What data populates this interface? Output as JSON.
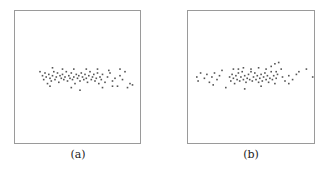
{
  "figure": {
    "panels": [
      {
        "id": "a",
        "caption": "(a)"
      },
      {
        "id": "b",
        "caption": "(b)"
      }
    ]
  },
  "chart_data": [
    {
      "type": "scatter",
      "title": "",
      "caption": "(a)",
      "xlabel": "",
      "ylabel": "",
      "axes_visible": false,
      "grid": false,
      "xlim": [
        0,
        1
      ],
      "ylim": [
        0,
        1
      ],
      "point_color": "#555555",
      "points": [
        [
          0.2,
          0.46
        ],
        [
          0.22,
          0.49
        ],
        [
          0.23,
          0.52
        ],
        [
          0.24,
          0.47
        ],
        [
          0.25,
          0.5
        ],
        [
          0.26,
          0.55
        ],
        [
          0.27,
          0.48
        ],
        [
          0.28,
          0.51
        ],
        [
          0.29,
          0.53
        ],
        [
          0.3,
          0.49
        ],
        [
          0.31,
          0.46
        ],
        [
          0.32,
          0.52
        ],
        [
          0.33,
          0.5
        ],
        [
          0.34,
          0.47
        ],
        [
          0.35,
          0.54
        ],
        [
          0.36,
          0.49
        ],
        [
          0.37,
          0.51
        ],
        [
          0.38,
          0.48
        ],
        [
          0.39,
          0.52
        ],
        [
          0.4,
          0.5
        ],
        [
          0.41,
          0.46
        ],
        [
          0.42,
          0.53
        ],
        [
          0.43,
          0.49
        ],
        [
          0.44,
          0.51
        ],
        [
          0.45,
          0.47
        ],
        [
          0.46,
          0.52
        ],
        [
          0.47,
          0.5
        ],
        [
          0.48,
          0.55
        ],
        [
          0.49,
          0.48
        ],
        [
          0.5,
          0.51
        ],
        [
          0.51,
          0.49
        ],
        [
          0.52,
          0.53
        ],
        [
          0.53,
          0.47
        ],
        [
          0.54,
          0.5
        ],
        [
          0.55,
          0.52
        ],
        [
          0.56,
          0.48
        ],
        [
          0.57,
          0.51
        ],
        [
          0.58,
          0.54
        ],
        [
          0.59,
          0.49
        ],
        [
          0.6,
          0.46
        ],
        [
          0.61,
          0.52
        ],
        [
          0.62,
          0.5
        ],
        [
          0.63,
          0.48
        ],
        [
          0.64,
          0.53
        ],
        [
          0.65,
          0.51
        ],
        [
          0.66,
          0.47
        ],
        [
          0.67,
          0.55
        ],
        [
          0.68,
          0.5
        ],
        [
          0.69,
          0.52
        ],
        [
          0.7,
          0.48
        ],
        [
          0.72,
          0.54
        ],
        [
          0.74,
          0.5
        ],
        [
          0.76,
          0.47
        ],
        [
          0.78,
          0.53
        ],
        [
          0.8,
          0.51
        ],
        [
          0.82,
          0.57
        ],
        [
          0.84,
          0.49
        ],
        [
          0.86,
          0.52
        ],
        [
          0.88,
          0.46
        ],
        [
          0.9,
          0.58
        ],
        [
          0.92,
          0.55
        ],
        [
          0.94,
          0.56
        ],
        [
          0.3,
          0.43
        ],
        [
          0.38,
          0.44
        ],
        [
          0.47,
          0.44
        ],
        [
          0.57,
          0.44
        ],
        [
          0.66,
          0.44
        ],
        [
          0.75,
          0.45
        ],
        [
          0.84,
          0.44
        ],
        [
          0.28,
          0.57
        ],
        [
          0.45,
          0.58
        ],
        [
          0.52,
          0.6
        ],
        [
          0.7,
          0.58
        ],
        [
          0.78,
          0.57
        ]
      ]
    },
    {
      "type": "scatter",
      "title": "",
      "caption": "(b)",
      "xlabel": "",
      "ylabel": "",
      "axes_visible": false,
      "grid": false,
      "xlim": [
        0,
        1
      ],
      "ylim": [
        0,
        1
      ],
      "point_color": "#555555",
      "points": [
        [
          0.07,
          0.5
        ],
        [
          0.08,
          0.53
        ],
        [
          0.1,
          0.47
        ],
        [
          0.13,
          0.51
        ],
        [
          0.15,
          0.48
        ],
        [
          0.17,
          0.54
        ],
        [
          0.19,
          0.5
        ],
        [
          0.21,
          0.47
        ],
        [
          0.23,
          0.52
        ],
        [
          0.25,
          0.49
        ],
        [
          0.27,
          0.45
        ],
        [
          0.33,
          0.5
        ],
        [
          0.34,
          0.53
        ],
        [
          0.35,
          0.48
        ],
        [
          0.36,
          0.51
        ],
        [
          0.37,
          0.55
        ],
        [
          0.38,
          0.49
        ],
        [
          0.39,
          0.52
        ],
        [
          0.4,
          0.47
        ],
        [
          0.41,
          0.53
        ],
        [
          0.42,
          0.5
        ],
        [
          0.43,
          0.46
        ],
        [
          0.44,
          0.52
        ],
        [
          0.45,
          0.49
        ],
        [
          0.46,
          0.54
        ],
        [
          0.47,
          0.51
        ],
        [
          0.48,
          0.48
        ],
        [
          0.49,
          0.52
        ],
        [
          0.5,
          0.46
        ],
        [
          0.51,
          0.53
        ],
        [
          0.52,
          0.5
        ],
        [
          0.53,
          0.47
        ],
        [
          0.54,
          0.52
        ],
        [
          0.55,
          0.49
        ],
        [
          0.56,
          0.54
        ],
        [
          0.57,
          0.51
        ],
        [
          0.58,
          0.48
        ],
        [
          0.59,
          0.53
        ],
        [
          0.6,
          0.5
        ],
        [
          0.61,
          0.47
        ],
        [
          0.62,
          0.52
        ],
        [
          0.63,
          0.49
        ],
        [
          0.64,
          0.54
        ],
        [
          0.65,
          0.51
        ],
        [
          0.66,
          0.46
        ],
        [
          0.67,
          0.52
        ],
        [
          0.68,
          0.49
        ],
        [
          0.69,
          0.55
        ],
        [
          0.7,
          0.51
        ],
        [
          0.71,
          0.48
        ],
        [
          0.36,
          0.44
        ],
        [
          0.4,
          0.44
        ],
        [
          0.44,
          0.43
        ],
        [
          0.5,
          0.44
        ],
        [
          0.56,
          0.43
        ],
        [
          0.62,
          0.44
        ],
        [
          0.66,
          0.42
        ],
        [
          0.69,
          0.4
        ],
        [
          0.72,
          0.39
        ],
        [
          0.74,
          0.44
        ],
        [
          0.7,
          0.46
        ],
        [
          0.75,
          0.5
        ],
        [
          0.77,
          0.53
        ],
        [
          0.8,
          0.49
        ],
        [
          0.83,
          0.52
        ],
        [
          0.86,
          0.48
        ],
        [
          0.88,
          0.46
        ],
        [
          0.94,
          0.44
        ],
        [
          0.99,
          0.5
        ],
        [
          0.2,
          0.56
        ],
        [
          0.3,
          0.58
        ],
        [
          0.45,
          0.59
        ],
        [
          0.58,
          0.57
        ],
        [
          0.8,
          0.55
        ]
      ]
    }
  ]
}
